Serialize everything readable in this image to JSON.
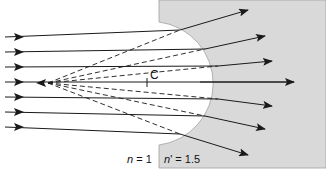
{
  "diagram": {
    "medium_left": {
      "label_n": "n",
      "label_eq": " = 1",
      "index": 1,
      "color": "#ffffff"
    },
    "medium_right": {
      "label_n": "n",
      "label_prime": "'",
      "label_eq": " = 1.5",
      "index": 1.5,
      "color": "#d9d9d9"
    },
    "center_label": "C",
    "incident_ray_ys": [
      37,
      52,
      67,
      82,
      97,
      112,
      127
    ],
    "virtual_focus": {
      "x": 48,
      "y": 83
    },
    "refracted_ray_ends": [
      [
        248,
        10
      ],
      [
        265,
        36
      ],
      [
        272,
        61
      ],
      [
        294,
        82
      ],
      [
        272,
        106
      ],
      [
        265,
        129
      ],
      [
        248,
        155
      ]
    ],
    "colors": {
      "ray": "#1a1a1a",
      "glass": "#d9d9d9",
      "glass_edge": "#a0a0a0"
    }
  }
}
